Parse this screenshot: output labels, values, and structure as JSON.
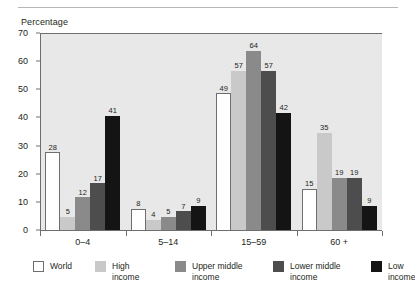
{
  "chart_data": {
    "type": "bar",
    "title": "",
    "ylabel": "Percentage",
    "xlabel": "",
    "ylim": [
      0,
      70
    ],
    "yticks": [
      0,
      10,
      20,
      30,
      40,
      50,
      60,
      70
    ],
    "grid": false,
    "legend_position": "bottom",
    "categories": [
      "0–4",
      "5–14",
      "15–59",
      "60 +"
    ],
    "series": [
      {
        "name": "World",
        "values": [
          28,
          8,
          49,
          15
        ],
        "color": "#ffffff"
      },
      {
        "name": "High\nincome",
        "values": [
          5,
          4,
          57,
          35
        ],
        "color": "#c9c9c9"
      },
      {
        "name": "Upper middle\nincome",
        "values": [
          12,
          5,
          64,
          19
        ],
        "color": "#8a8a8a"
      },
      {
        "name": "Lower middle\nincome",
        "values": [
          17,
          7,
          57,
          19
        ],
        "color": "#4d4d4d"
      },
      {
        "name": "Low\nincome",
        "values": [
          41,
          9,
          42,
          9
        ],
        "color": "#141414"
      }
    ]
  },
  "figure": {
    "plot_background": "#e8e8e8",
    "axis_color": "#6e6e6e",
    "text_color": "#231f20"
  }
}
